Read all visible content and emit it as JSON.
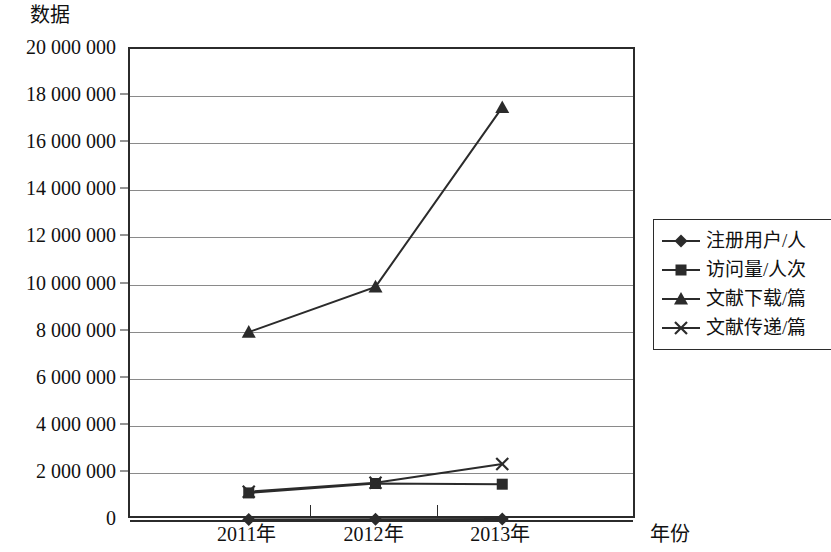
{
  "chart_data": {
    "type": "line",
    "title": "",
    "ylabel": "数据",
    "xlabel": "年份",
    "categories": [
      "2011年",
      "2012年",
      "2013年"
    ],
    "ylim": [
      0,
      20000000
    ],
    "ytick_step": 2000000,
    "ytick_labels": [
      "20 000 000",
      "18 000 000",
      "16 000 000",
      "14 000 000",
      "12 000 000",
      "10 000 000",
      "8 000 000",
      "6 000 000",
      "4 000 000",
      "2 000 000",
      "0"
    ],
    "ytick_values": [
      20000000,
      18000000,
      16000000,
      14000000,
      12000000,
      10000000,
      8000000,
      6000000,
      4000000,
      2000000,
      0
    ],
    "grid": true,
    "legend_position": "right",
    "series": [
      {
        "name": "注册用户/人",
        "marker": "diamond",
        "values": [
          20000,
          30000,
          40000
        ]
      },
      {
        "name": "访问量/人次",
        "marker": "square",
        "values": [
          1150000,
          1550000,
          1520000
        ]
      },
      {
        "name": "文献下载/篇",
        "marker": "triangle",
        "values": [
          7980000,
          9900000,
          17520000
        ]
      },
      {
        "name": "文献传递/篇",
        "marker": "x",
        "values": [
          1200000,
          1580000,
          2380000
        ]
      }
    ],
    "colors": {
      "line": "#2b2b2b",
      "grid": "#8a8a8a",
      "axis": "#2b2b2b",
      "background": "#ffffff"
    }
  }
}
